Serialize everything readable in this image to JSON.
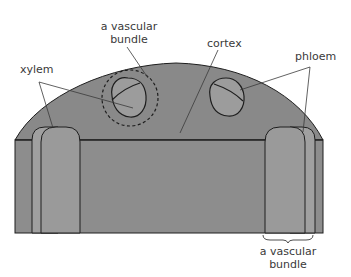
{
  "diagram": {
    "labels": {
      "vascular_bundle_top_line1": "a vascular",
      "vascular_bundle_top_line2": "bundle",
      "xylem": "xylem",
      "cortex": "cortex",
      "phloem": "phloem",
      "vascular_bundle_bottom_line1": "a vascular",
      "vascular_bundle_bottom_line2": "bundle"
    },
    "colors": {
      "cortex_fill": "#8a8a8a",
      "bundle_fill": "#9a9a9a",
      "outline": "#1e1e1e",
      "label_text": "#3a3a3a",
      "background": "#ffffff"
    }
  }
}
